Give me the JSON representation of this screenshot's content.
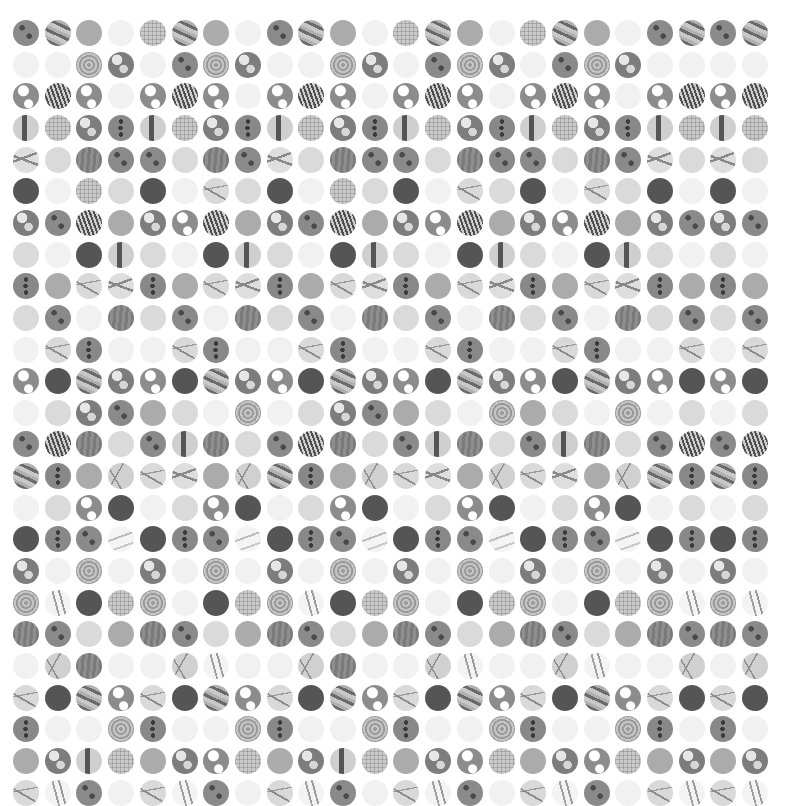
{
  "grid": {
    "columns": 24,
    "rows": 25,
    "cell_diameter": 26,
    "origin_x": 13,
    "origin_y": 20,
    "pitch_x": 31.7,
    "pitch_y": 31.65,
    "background": "#ffffff",
    "legend": {
      "S": "spots",
      "D": "dots",
      "T": "stripes",
      "F": "flat",
      "B": "blank",
      "G": "light",
      "X": "dark",
      "K": "wood",
      "P": "plaid",
      "R": "bar",
      "Z": "brain",
      "O": "blob",
      "H": "patchy",
      "L": "leaf",
      "W": "wave",
      "M": "marble",
      "N": "tangled",
      "V": "veil",
      "E": "feather"
    },
    "cells": [
      "STFBPTFBSTFBPTFBPTFBSTST",
      "BBZOBSZOBBZOBSZOBSZOBBBB",
      "HLHBHLHBHLHBHLHBHLHBHLHL",
      "RPODRPODRPODRPODRPODRPRP",
      "WGKSSGKSWGKSSGKSSGKSWGWG",
      "XBPGXBMGXBPGXBMGXBMGXBXB",
      "OSLFOHLFOSLFOHLFOHLFOSOS",
      "GBXRGBXRGBXRGBXRGBXRGBGB",
      "DFMWDFMWDFMWDFMWDFMWDFDF",
      "GSBKGSBKGSBKGSBKGSBKGSGS",
      "BMDBBMDBBMDBBMDBBMDBBMBM",
      "HXTOHXTOHXTOHXTOHXTOHXHX",
      "BGOSFGBZBGOSFGBZFGBZBGBG",
      "SLKGSRKGSLKGSRKGSRKGSLSL",
      "TDFNMWFNTDFNMWFNMWFNTDTD",
      "BGHXBGHXBGHXBGHXBGHXBGBG",
      "XDSVXDSVXDSVXDSVXDSVXDXD",
      "OBZBOBZBOBZBOBZBOBZBOBOB",
      "ZEXPZBXPZEXPZBXPZBXPZEZE",
      "KSGFKSGFKSGFKSGFKSGFKSKS",
      "BNKBBNEBBNKBBNEBBNEBBNBN",
      "MXTHMXTHMXTHMXTHMXTHMXMX",
      "DBBZDBBZDBBZDBBZDBBZDBDB",
      "FORPFOHPFORPFOHPFOHPFOFO",
      "MESBMESBMESBMESBMESBMEME"
    ]
  }
}
